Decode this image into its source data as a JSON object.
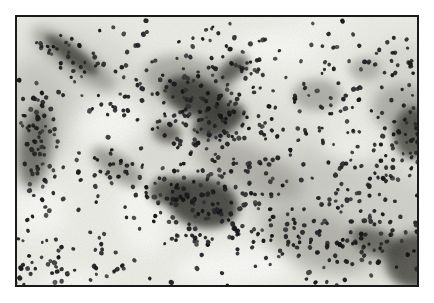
{
  "figure": {
    "type": "micrograph",
    "frame": {
      "border_color": "#1a1a1a",
      "border_width": 2,
      "page_background": "#ffffff"
    },
    "micrograph": {
      "width": 400,
      "height": 268,
      "background": "#eeeee9",
      "seed": 42,
      "grain": {
        "base_frequency": 0.9,
        "octaves": 2,
        "seed": 11,
        "gray": 0.4,
        "opacity": 0.3
      },
      "blobs": [
        {
          "x": 200,
          "y": 130,
          "rx": 130,
          "ry": 62,
          "rot": 15,
          "color": "#cfcfc9",
          "opacity": 0.5,
          "blur": 16
        },
        {
          "x": 70,
          "y": 60,
          "rx": 75,
          "ry": 48,
          "rot": 30,
          "color": "#c9c9c3",
          "opacity": 0.5,
          "blur": 14
        },
        {
          "x": 330,
          "y": 195,
          "rx": 95,
          "ry": 62,
          "rot": 10,
          "color": "#bdbdb7",
          "opacity": 0.6,
          "blur": 12
        },
        {
          "x": 14,
          "y": 100,
          "rx": 40,
          "ry": 55,
          "rot": 0,
          "color": "#b2b2ac",
          "opacity": 0.55,
          "blur": 10
        },
        {
          "x": 385,
          "y": 62,
          "rx": 42,
          "ry": 38,
          "rot": 0,
          "color": "#c6c6c0",
          "opacity": 0.5,
          "blur": 10
        },
        {
          "x": 95,
          "y": 105,
          "rx": 36,
          "ry": 27,
          "rot": -15,
          "color": "#fcfcfa",
          "opacity": 0.9,
          "blur": 10
        },
        {
          "x": 262,
          "y": 30,
          "rx": 42,
          "ry": 17,
          "rot": 0,
          "color": "#fbfbf9",
          "opacity": 0.85,
          "blur": 9
        },
        {
          "x": 220,
          "y": 250,
          "rx": 62,
          "ry": 18,
          "rot": -5,
          "color": "#fcfcfa",
          "opacity": 0.9,
          "blur": 8
        },
        {
          "x": 22,
          "y": 195,
          "rx": 28,
          "ry": 24,
          "rot": 0,
          "color": "#fbfbf9",
          "opacity": 0.85,
          "blur": 9
        },
        {
          "x": 125,
          "y": 200,
          "rx": 22,
          "ry": 38,
          "rot": -12,
          "color": "#fafaf8",
          "opacity": 0.85,
          "blur": 8
        },
        {
          "x": 332,
          "y": 130,
          "rx": 28,
          "ry": 13,
          "rot": 8,
          "color": "#f7f7f3",
          "opacity": 0.8,
          "blur": 8
        },
        {
          "x": 305,
          "y": 8,
          "rx": 34,
          "ry": 11,
          "rot": 0,
          "color": "#f8f8f4",
          "opacity": 0.7,
          "blur": 8
        },
        {
          "x": 55,
          "y": 266,
          "rx": 32,
          "ry": 12,
          "rot": 0,
          "color": "#fafaf8",
          "opacity": 0.8,
          "blur": 8
        },
        {
          "x": 57,
          "y": 42,
          "rx": 50,
          "ry": 14,
          "rot": 36,
          "color": "#8a8a84",
          "opacity": 0.7,
          "blur": 6
        },
        {
          "x": 172,
          "y": 66,
          "rx": 46,
          "ry": 26,
          "rot": 15,
          "color": "#90908a",
          "opacity": 0.7,
          "blur": 6
        },
        {
          "x": 300,
          "y": 78,
          "rx": 25,
          "ry": 16,
          "rot": 0,
          "color": "#9a9a94",
          "opacity": 0.75,
          "blur": 5
        },
        {
          "x": 348,
          "y": 52,
          "rx": 16,
          "ry": 11,
          "rot": 0,
          "color": "#9c9c96",
          "opacity": 0.7,
          "blur": 5
        },
        {
          "x": 232,
          "y": 152,
          "rx": 58,
          "ry": 22,
          "rot": 24,
          "color": "#94948c",
          "opacity": 0.6,
          "blur": 7
        },
        {
          "x": 385,
          "y": 92,
          "rx": 30,
          "ry": 24,
          "rot": 0,
          "color": "#8e8e88",
          "opacity": 0.6,
          "blur": 6
        },
        {
          "x": 300,
          "y": 224,
          "rx": 55,
          "ry": 28,
          "rot": 18,
          "color": "#9a9a92",
          "opacity": 0.55,
          "blur": 8
        },
        {
          "x": 100,
          "y": 150,
          "rx": 30,
          "ry": 12,
          "rot": 35,
          "color": "#6e6e66",
          "opacity": 0.6,
          "blur": 5
        },
        {
          "x": 178,
          "y": 80,
          "rx": 33,
          "ry": 19,
          "rot": 20,
          "color": "#2e2e2a",
          "opacity": 0.85,
          "blur": 4
        },
        {
          "x": 202,
          "y": 104,
          "rx": 28,
          "ry": 15,
          "rot": -25,
          "color": "#2a2a26",
          "opacity": 0.85,
          "blur": 4
        },
        {
          "x": 216,
          "y": 52,
          "rx": 18,
          "ry": 10,
          "rot": -40,
          "color": "#3a3a36",
          "opacity": 0.8,
          "blur": 4
        },
        {
          "x": 150,
          "y": 116,
          "rx": 14,
          "ry": 10,
          "rot": 10,
          "color": "#3c3c36",
          "opacity": 0.75,
          "blur": 4
        },
        {
          "x": 186,
          "y": 186,
          "rx": 36,
          "ry": 25,
          "rot": 12,
          "color": "#2c2c28",
          "opacity": 0.85,
          "blur": 4
        },
        {
          "x": 152,
          "y": 174,
          "rx": 20,
          "ry": 14,
          "rot": 0,
          "color": "#34342f",
          "opacity": 0.8,
          "blur": 4
        },
        {
          "x": 396,
          "y": 116,
          "rx": 20,
          "ry": 26,
          "rot": 0,
          "color": "#34342f",
          "opacity": 0.8,
          "blur": 4
        },
        {
          "x": 398,
          "y": 244,
          "rx": 30,
          "ry": 28,
          "rot": 0,
          "color": "#30302b",
          "opacity": 0.8,
          "blur": 5
        },
        {
          "x": 360,
          "y": 226,
          "rx": 28,
          "ry": 13,
          "rot": 22,
          "color": "#3e3e38",
          "opacity": 0.7,
          "blur": 5
        },
        {
          "x": 55,
          "y": 38,
          "rx": 32,
          "ry": 8,
          "rot": 36,
          "color": "#3a3a34",
          "opacity": 0.8,
          "blur": 3
        },
        {
          "x": 18,
          "y": 130,
          "rx": 16,
          "ry": 42,
          "rot": 8,
          "color": "#3a3a34",
          "opacity": 0.65,
          "blur": 6
        }
      ],
      "dots": {
        "palette": [
          "#131315",
          "#1b1b1d",
          "#242426",
          "#333335"
        ],
        "min_radius": 1.6,
        "max_radius": 2.5,
        "softness": 0.35,
        "groups": [
          {
            "x": 40,
            "y": 32,
            "sx": 16,
            "sy": 9,
            "count": 16
          },
          {
            "x": 75,
            "y": 52,
            "sx": 16,
            "sy": 9,
            "count": 16
          },
          {
            "x": 180,
            "y": 85,
            "sx": 30,
            "sy": 24,
            "count": 85
          },
          {
            "x": 205,
            "y": 110,
            "sx": 22,
            "sy": 15,
            "count": 40
          },
          {
            "x": 216,
            "y": 52,
            "sx": 14,
            "sy": 8,
            "count": 14
          },
          {
            "x": 186,
            "y": 188,
            "sx": 30,
            "sy": 22,
            "count": 75
          },
          {
            "x": 152,
            "y": 175,
            "sx": 16,
            "sy": 12,
            "count": 22
          },
          {
            "x": 195,
            "y": 222,
            "sx": 35,
            "sy": 8,
            "count": 20
          },
          {
            "x": 25,
            "y": 100,
            "sx": 13,
            "sy": 22,
            "count": 26
          },
          {
            "x": 22,
            "y": 132,
            "sx": 14,
            "sy": 30,
            "count": 40
          },
          {
            "x": 100,
            "y": 150,
            "sx": 22,
            "sy": 11,
            "count": 24
          },
          {
            "x": 108,
            "y": 82,
            "sx": 18,
            "sy": 16,
            "count": 20
          },
          {
            "x": 35,
            "y": 250,
            "sx": 24,
            "sy": 18,
            "count": 40
          },
          {
            "x": 90,
            "y": 240,
            "sx": 20,
            "sy": 14,
            "count": 16
          },
          {
            "x": 396,
            "y": 120,
            "sx": 16,
            "sy": 26,
            "count": 40
          },
          {
            "x": 330,
            "y": 205,
            "sx": 45,
            "sy": 38,
            "count": 85
          },
          {
            "x": 360,
            "y": 228,
            "sx": 24,
            "sy": 12,
            "count": 20
          },
          {
            "x": 240,
            "y": 150,
            "sx": 34,
            "sy": 18,
            "count": 40
          },
          {
            "x": 295,
            "y": 65,
            "sx": 40,
            "sy": 28,
            "count": 40
          },
          {
            "x": 380,
            "y": 42,
            "sx": 24,
            "sy": 16,
            "count": 22
          },
          {
            "x": 262,
            "y": 212,
            "sx": 24,
            "sy": 18,
            "count": 22
          },
          {
            "x": 350,
            "y": 150,
            "sx": 24,
            "sy": 18,
            "count": 24
          },
          {
            "x": 300,
            "y": 245,
            "sx": 28,
            "sy": 16,
            "count": 20
          },
          {
            "x": 160,
            "y": 30,
            "sx": 30,
            "sy": 11,
            "count": 14
          },
          {
            "x": 230,
            "y": 28,
            "sx": 24,
            "sy": 10,
            "count": 12
          },
          {
            "x": 330,
            "y": 95,
            "sx": 20,
            "sy": 14,
            "count": 18
          }
        ],
        "scatter_count": 120
      }
    }
  }
}
